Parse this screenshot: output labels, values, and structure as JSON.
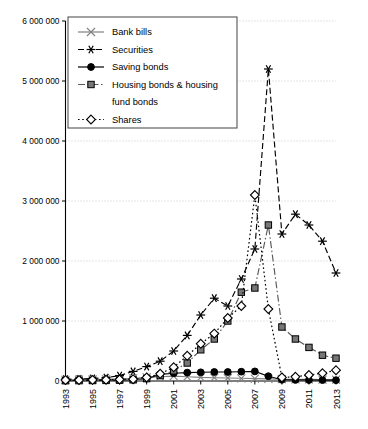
{
  "chart_data": {
    "type": "line",
    "title": "",
    "xlabel": "",
    "ylabel": "",
    "grid": "horizontal dotted gridlines at every 1 000 000",
    "legend_position": "top-left inside plot area",
    "x": [
      1993,
      1994,
      1995,
      1996,
      1997,
      1998,
      1999,
      2000,
      2001,
      2002,
      2003,
      2004,
      2005,
      2006,
      2007,
      2008,
      2009,
      2010,
      2011,
      2012,
      2013
    ],
    "xtick_labels": [
      "1993",
      "1995",
      "1997",
      "1999",
      "2001",
      "2003",
      "2005",
      "2007",
      "2009",
      "2011",
      "2013"
    ],
    "ytick_labels": [
      "0",
      "1 000 000",
      "2 000 000",
      "3 000 000",
      "4 000 000",
      "5 000 000",
      "6 000 000"
    ],
    "ytick_values": [
      0,
      1000000,
      2000000,
      3000000,
      4000000,
      5000000,
      6000000
    ],
    "ylim": [
      0,
      6000000
    ],
    "xlim": [
      1993,
      2013
    ],
    "series": [
      {
        "name": "Bank bills",
        "marker": "x-thin",
        "line": "solid",
        "color": "#808080",
        "values": [
          20000,
          22000,
          25000,
          28000,
          35000,
          45000,
          60000,
          70000,
          80000,
          70000,
          60000,
          55000,
          50000,
          45000,
          40000,
          35000,
          30000,
          28000,
          26000,
          24000,
          22000
        ]
      },
      {
        "name": "Securities",
        "marker": "asterisk",
        "line": "dashed",
        "color": "#000000",
        "values": [
          30000,
          35000,
          42000,
          55000,
          90000,
          160000,
          240000,
          330000,
          500000,
          760000,
          1100000,
          1380000,
          1250000,
          1700000,
          2200000,
          5200000,
          2450000,
          2780000,
          2600000,
          2330000,
          1800000
        ]
      },
      {
        "name": "Saving bonds",
        "marker": "filled-circle",
        "line": "solid",
        "color": "#000000",
        "values": [
          8000,
          9000,
          10000,
          12000,
          15000,
          20000,
          40000,
          110000,
          130000,
          140000,
          145000,
          150000,
          150000,
          155000,
          160000,
          80000,
          20000,
          18000,
          16000,
          15000,
          14000
        ]
      },
      {
        "name": "Housing bonds & housing fund bonds",
        "marker": "filled-square",
        "line": "dash-dot",
        "color": "#595959",
        "values": [
          5000,
          6000,
          8000,
          10000,
          14000,
          20000,
          40000,
          90000,
          170000,
          300000,
          520000,
          700000,
          1000000,
          1480000,
          1550000,
          2600000,
          900000,
          700000,
          560000,
          430000,
          380000
        ]
      },
      {
        "name": "Shares",
        "marker": "open-diamond",
        "line": "dotted",
        "color": "#000000",
        "values": [
          15000,
          16000,
          18000,
          20000,
          25000,
          30000,
          60000,
          120000,
          230000,
          420000,
          620000,
          790000,
          1050000,
          1250000,
          3100000,
          1200000,
          60000,
          70000,
          100000,
          130000,
          180000
        ]
      }
    ]
  },
  "legend": {
    "items": [
      {
        "label": "Bank bills"
      },
      {
        "label": "Securities"
      },
      {
        "label": "Saving bonds"
      },
      {
        "label": "Housing bonds & housing"
      },
      {
        "label": "fund bonds"
      },
      {
        "label": "Shares"
      }
    ]
  }
}
